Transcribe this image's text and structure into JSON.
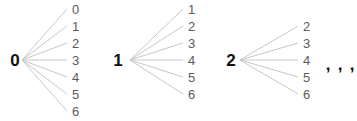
{
  "figure": {
    "width": 357,
    "height": 121,
    "background_color": "#ffffff",
    "edge_color": "#c8c8c8",
    "root_color": "#111111",
    "leaf_color": "#5a5a5a"
  },
  "chart_data": {
    "type": "diagram",
    "diagram_kind": "tree-fan",
    "title": "",
    "xlabel": "",
    "ylabel": "",
    "clusters": [
      {
        "root": "0",
        "root_x": 15,
        "root_y": 60,
        "origin_x": 22,
        "origin_y": 60,
        "leaf_x": 72,
        "leaves": [
          {
            "label": "0",
            "y": 9
          },
          {
            "label": "1",
            "y": 26
          },
          {
            "label": "2",
            "y": 43
          },
          {
            "label": "3",
            "y": 60
          },
          {
            "label": "4",
            "y": 77
          },
          {
            "label": "5",
            "y": 94
          },
          {
            "label": "6",
            "y": 111
          }
        ]
      },
      {
        "root": "1",
        "root_x": 118,
        "root_y": 60,
        "origin_x": 130,
        "origin_y": 60,
        "leaf_x": 188,
        "leaves": [
          {
            "label": "1",
            "y": 9
          },
          {
            "label": "2",
            "y": 26
          },
          {
            "label": "3",
            "y": 43
          },
          {
            "label": "4",
            "y": 60
          },
          {
            "label": "5",
            "y": 77
          },
          {
            "label": "6",
            "y": 94
          }
        ]
      },
      {
        "root": "2",
        "root_x": 231,
        "root_y": 60,
        "origin_x": 240,
        "origin_y": 60,
        "leaf_x": 303,
        "leaves": [
          {
            "label": "2",
            "y": 26
          },
          {
            "label": "3",
            "y": 43
          },
          {
            "label": "4",
            "y": 60
          },
          {
            "label": "5",
            "y": 77
          },
          {
            "label": "6",
            "y": 94
          }
        ]
      }
    ],
    "continuation": {
      "marks": [
        {
          "label": ",",
          "x": 328,
          "y": 64
        },
        {
          "label": ",",
          "x": 340,
          "y": 64
        },
        {
          "label": ",",
          "x": 352,
          "y": 64
        }
      ]
    }
  }
}
